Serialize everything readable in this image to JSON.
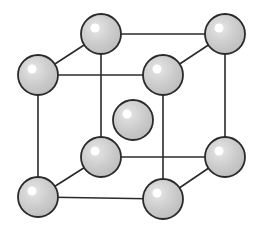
{
  "diagram": {
    "type": "body-centered-cubic-unit-cell",
    "colors": {
      "background": "#ffffff",
      "edge": "#2a2a2a",
      "atom_fill": "#c8c8c8",
      "atom_stroke": "#2a2a2a",
      "highlight": "#ffffff"
    },
    "atom_radius": 20,
    "atoms": [
      {
        "id": "back-top-left",
        "x": 101,
        "y": 34
      },
      {
        "id": "back-top-right",
        "x": 225,
        "y": 34
      },
      {
        "id": "back-bottom-left",
        "x": 101,
        "y": 157
      },
      {
        "id": "back-bottom-right",
        "x": 225,
        "y": 157
      },
      {
        "id": "body-center",
        "x": 133,
        "y": 120
      },
      {
        "id": "front-top-left",
        "x": 38,
        "y": 75
      },
      {
        "id": "front-top-right",
        "x": 163,
        "y": 75
      },
      {
        "id": "front-bottom-left",
        "x": 38,
        "y": 197
      },
      {
        "id": "front-bottom-right",
        "x": 163,
        "y": 199
      }
    ],
    "edges": [
      [
        "back-top-left",
        "back-top-right"
      ],
      [
        "back-top-left",
        "back-bottom-left"
      ],
      [
        "back-top-right",
        "back-bottom-right"
      ],
      [
        "back-bottom-left",
        "back-bottom-right"
      ],
      [
        "front-top-left",
        "front-top-right"
      ],
      [
        "front-top-left",
        "front-bottom-left"
      ],
      [
        "front-top-right",
        "front-bottom-right"
      ],
      [
        "front-bottom-left",
        "front-bottom-right"
      ],
      [
        "front-top-left",
        "back-top-left"
      ],
      [
        "front-top-right",
        "back-top-right"
      ],
      [
        "front-bottom-left",
        "back-bottom-left"
      ],
      [
        "front-bottom-right",
        "back-bottom-right"
      ]
    ]
  }
}
